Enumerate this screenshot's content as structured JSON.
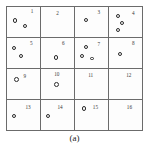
{
  "figure": {
    "caption": "(a)",
    "title": "",
    "grid": {
      "rows": 4,
      "cols": 4,
      "border_color": "#6b6b6b",
      "background_color": "#ffffff"
    }
  },
  "chart_data": {
    "type": "heatmap",
    "title": "",
    "xlabel": "",
    "ylabel": "",
    "grid_rows": 4,
    "grid_cols": 4,
    "categories": [
      "1",
      "2",
      "3",
      "4",
      "5",
      "6",
      "7",
      "8",
      "9",
      "10",
      "11",
      "12",
      "13",
      "14",
      "15",
      "16"
    ],
    "values": [
      2,
      0,
      1,
      3,
      2,
      1,
      3,
      1,
      1,
      1,
      0,
      0,
      1,
      1,
      1,
      0
    ],
    "legend": [],
    "annotations": [
      "(a)"
    ]
  },
  "cells": [
    {
      "id": "cell-1",
      "label": "1",
      "label_pos": {
        "left": 72,
        "top": 8
      },
      "count": 2,
      "dots": [
        {
          "left": 18,
          "top": 38,
          "size": "normal"
        },
        {
          "left": 48,
          "top": 56,
          "size": "normal"
        }
      ]
    },
    {
      "id": "cell-2",
      "label": "2",
      "label_pos": {
        "left": 46,
        "top": 12
      },
      "count": 0,
      "dots": []
    },
    {
      "id": "cell-3",
      "label": "3",
      "label_pos": {
        "left": 68,
        "top": 10
      },
      "count": 1,
      "dots": [
        {
          "left": 28,
          "top": 36,
          "size": "normal"
        }
      ]
    },
    {
      "id": "cell-4",
      "label": "4",
      "label_pos": {
        "left": 70,
        "top": 12
      },
      "count": 3,
      "dots": [
        {
          "left": 20,
          "top": 22,
          "size": "normal"
        },
        {
          "left": 33,
          "top": 46,
          "size": "normal"
        },
        {
          "left": 20,
          "top": 70,
          "size": "normal"
        }
      ]
    },
    {
      "id": "cell-5",
      "label": "5",
      "label_pos": {
        "left": 70,
        "top": 10
      },
      "count": 2,
      "dots": [
        {
          "left": 16,
          "top": 26,
          "size": "normal"
        },
        {
          "left": 36,
          "top": 52,
          "size": "normal"
        }
      ]
    },
    {
      "id": "cell-6",
      "label": "6",
      "label_pos": {
        "left": 64,
        "top": 10
      },
      "count": 1,
      "dots": [
        {
          "left": 40,
          "top": 58,
          "size": "normal"
        }
      ]
    },
    {
      "id": "cell-7",
      "label": "7",
      "label_pos": {
        "left": 68,
        "top": 14
      },
      "count": 3,
      "dots": [
        {
          "left": 26,
          "top": 24,
          "size": "normal"
        },
        {
          "left": 14,
          "top": 52,
          "size": "normal"
        },
        {
          "left": 46,
          "top": 62,
          "size": "small"
        }
      ]
    },
    {
      "id": "cell-8",
      "label": "8",
      "label_pos": {
        "left": 70,
        "top": 10
      },
      "count": 1,
      "dots": [
        {
          "left": 26,
          "top": 46,
          "size": "normal"
        }
      ]
    },
    {
      "id": "cell-9",
      "label": "9",
      "label_pos": {
        "left": 50,
        "top": 16
      },
      "count": 1,
      "dots": [
        {
          "left": 22,
          "top": 26,
          "size": "big"
        }
      ]
    },
    {
      "id": "cell-10",
      "label": "10",
      "label_pos": {
        "left": 40,
        "top": 10
      },
      "count": 1,
      "dots": [
        {
          "left": 40,
          "top": 44,
          "size": "big"
        }
      ]
    },
    {
      "id": "cell-11",
      "label": "11",
      "label_pos": {
        "left": 40,
        "top": 12
      },
      "count": 0,
      "dots": []
    },
    {
      "id": "cell-12",
      "label": "12",
      "label_pos": {
        "left": 52,
        "top": 12
      },
      "count": 0,
      "dots": []
    },
    {
      "id": "cell-13",
      "label": "13",
      "label_pos": {
        "left": 56,
        "top": 16
      },
      "count": 1,
      "dots": [
        {
          "left": 16,
          "top": 46,
          "size": "normal"
        }
      ]
    },
    {
      "id": "cell-14",
      "label": "14",
      "label_pos": {
        "left": 50,
        "top": 16
      },
      "count": 1,
      "dots": [
        {
          "left": 16,
          "top": 46,
          "size": "normal"
        }
      ]
    },
    {
      "id": "cell-15",
      "label": "15",
      "label_pos": {
        "left": 54,
        "top": 18
      },
      "count": 1,
      "dots": [
        {
          "left": 20,
          "top": 20,
          "size": "big"
        }
      ]
    },
    {
      "id": "cell-16",
      "label": "16",
      "label_pos": {
        "left": 54,
        "top": 16
      },
      "count": 0,
      "dots": []
    }
  ]
}
